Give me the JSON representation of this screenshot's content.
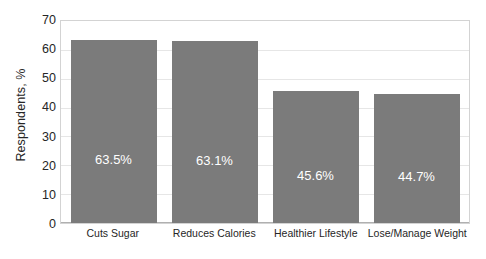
{
  "chart_data": {
    "type": "bar",
    "title": "",
    "subtitle": "",
    "xlabel": "",
    "ylabel": "Respondents, %",
    "ylim": [
      0,
      70
    ],
    "ytick_step": 10,
    "yticks": [
      "70",
      "60",
      "50",
      "40",
      "30",
      "20",
      "10",
      "0"
    ],
    "grid": "horizontal",
    "legend": "none",
    "bar_color": "#7b7b7b",
    "label_color": "#ffffff",
    "categories": [
      "Cuts Sugar",
      "Reduces Calories",
      "Healthier Lifestyle",
      "Lose/Manage Weight"
    ],
    "values": [
      63.5,
      63.1,
      45.6,
      44.7
    ],
    "data_labels": [
      "63.5%",
      "63.1%",
      "45.6%",
      "44.7%"
    ]
  }
}
